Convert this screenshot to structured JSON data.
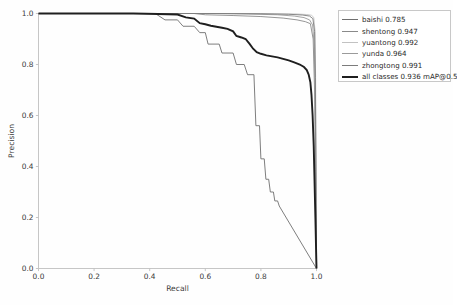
{
  "chart_data": {
    "type": "line",
    "title": "",
    "xlabel": "Recall",
    "ylabel": "Precision",
    "xlim": [
      0.0,
      1.0
    ],
    "ylim": [
      0.0,
      1.0
    ],
    "xticks": [
      "0.0",
      "0.2",
      "0.4",
      "0.6",
      "0.8",
      "1.0"
    ],
    "yticks": [
      "0.0",
      "0.2",
      "0.4",
      "0.6",
      "0.8",
      "1.0"
    ],
    "xtick_values": [
      0.0,
      0.2,
      0.4,
      0.6,
      0.8,
      1.0
    ],
    "ytick_values": [
      0.0,
      0.2,
      0.4,
      0.6,
      0.8,
      1.0
    ],
    "grid": false,
    "legend_position": "upper right outside",
    "metric_label": "mAP@0.5",
    "series": [
      {
        "name": "baishi",
        "score": "0.785",
        "label": "baishi 0.785",
        "color": "#6f6f6f",
        "width": 0.9,
        "points": [
          [
            0.0,
            1.0
          ],
          [
            0.3,
            1.0
          ],
          [
            0.42,
            1.0
          ],
          [
            0.455,
            0.975
          ],
          [
            0.5,
            0.975
          ],
          [
            0.52,
            0.95
          ],
          [
            0.56,
            0.95
          ],
          [
            0.58,
            0.925
          ],
          [
            0.6,
            0.925
          ],
          [
            0.61,
            0.88
          ],
          [
            0.65,
            0.88
          ],
          [
            0.66,
            0.845
          ],
          [
            0.7,
            0.845
          ],
          [
            0.712,
            0.8
          ],
          [
            0.74,
            0.8
          ],
          [
            0.752,
            0.76
          ],
          [
            0.775,
            0.76
          ],
          [
            0.782,
            0.56
          ],
          [
            0.795,
            0.56
          ],
          [
            0.8,
            0.43
          ],
          [
            0.812,
            0.43
          ],
          [
            0.818,
            0.35
          ],
          [
            0.828,
            0.35
          ],
          [
            0.834,
            0.3
          ],
          [
            0.845,
            0.3
          ],
          [
            0.85,
            0.265
          ],
          [
            0.86,
            0.265
          ],
          [
            0.866,
            0.245
          ],
          [
            1.0,
            0.0
          ]
        ]
      },
      {
        "name": "shentong",
        "score": "0.947",
        "label": "shentong 0.947",
        "color": "#8a8a8a",
        "width": 0.9,
        "points": [
          [
            0.0,
            1.0
          ],
          [
            0.56,
            1.0
          ],
          [
            0.6,
            0.995
          ],
          [
            0.7,
            0.992
          ],
          [
            0.8,
            0.988
          ],
          [
            0.88,
            0.982
          ],
          [
            0.93,
            0.975
          ],
          [
            0.96,
            0.968
          ],
          [
            0.978,
            0.96
          ],
          [
            0.988,
            0.9
          ],
          [
            0.993,
            0.7
          ],
          [
            0.996,
            0.4
          ],
          [
            0.999,
            0.1
          ],
          [
            1.0,
            0.0
          ]
        ]
      },
      {
        "name": "yuantong",
        "score": "0.992",
        "label": "yuantong 0.992",
        "color": "#c2c2c2",
        "width": 0.9,
        "points": [
          [
            0.0,
            1.0
          ],
          [
            0.7,
            1.0
          ],
          [
            0.85,
            0.999
          ],
          [
            0.93,
            0.998
          ],
          [
            0.965,
            0.996
          ],
          [
            0.982,
            0.993
          ],
          [
            0.99,
            0.985
          ],
          [
            0.995,
            0.93
          ],
          [
            0.997,
            0.72
          ],
          [
            0.999,
            0.3
          ],
          [
            1.0,
            0.0
          ]
        ]
      },
      {
        "name": "yunda",
        "score": "0.964",
        "label": "yunda 0.964",
        "color": "#9b9b9b",
        "width": 0.9,
        "points": [
          [
            0.0,
            1.0
          ],
          [
            0.62,
            1.0
          ],
          [
            0.75,
            0.998
          ],
          [
            0.86,
            0.995
          ],
          [
            0.92,
            0.99
          ],
          [
            0.955,
            0.984
          ],
          [
            0.975,
            0.975
          ],
          [
            0.986,
            0.955
          ],
          [
            0.992,
            0.87
          ],
          [
            0.996,
            0.6
          ],
          [
            0.999,
            0.2
          ],
          [
            1.0,
            0.0
          ]
        ]
      },
      {
        "name": "zhongtong",
        "score": "0.991",
        "label": "zhongtong 0.991",
        "color": "#7c7c7c",
        "width": 0.9,
        "points": [
          [
            0.0,
            1.0
          ],
          [
            0.66,
            1.0
          ],
          [
            0.8,
            0.999
          ],
          [
            0.9,
            0.997
          ],
          [
            0.95,
            0.994
          ],
          [
            0.975,
            0.99
          ],
          [
            0.987,
            0.98
          ],
          [
            0.993,
            0.93
          ],
          [
            0.996,
            0.75
          ],
          [
            0.998,
            0.38
          ],
          [
            1.0,
            0.0
          ]
        ]
      },
      {
        "name": "all classes",
        "score": "0.936",
        "label": "all classes 0.936 mAP@0.5",
        "color": "#1f1f1f",
        "width": 1.9,
        "points": [
          [
            0.0,
            1.0
          ],
          [
            0.34,
            1.0
          ],
          [
            0.43,
            0.998
          ],
          [
            0.5,
            0.996
          ],
          [
            0.53,
            0.985
          ],
          [
            0.56,
            0.98
          ],
          [
            0.58,
            0.962
          ],
          [
            0.6,
            0.958
          ],
          [
            0.62,
            0.952
          ],
          [
            0.64,
            0.948
          ],
          [
            0.66,
            0.944
          ],
          [
            0.68,
            0.94
          ],
          [
            0.7,
            0.93
          ],
          [
            0.712,
            0.912
          ],
          [
            0.73,
            0.906
          ],
          [
            0.745,
            0.9
          ],
          [
            0.76,
            0.88
          ],
          [
            0.772,
            0.862
          ],
          [
            0.785,
            0.848
          ],
          [
            0.8,
            0.842
          ],
          [
            0.82,
            0.836
          ],
          [
            0.84,
            0.832
          ],
          [
            0.86,
            0.828
          ],
          [
            0.88,
            0.822
          ],
          [
            0.9,
            0.816
          ],
          [
            0.92,
            0.808
          ],
          [
            0.94,
            0.8
          ],
          [
            0.955,
            0.79
          ],
          [
            0.965,
            0.778
          ],
          [
            0.972,
            0.76
          ],
          [
            0.978,
            0.73
          ],
          [
            0.982,
            0.68
          ],
          [
            0.986,
            0.6
          ],
          [
            0.99,
            0.48
          ],
          [
            0.993,
            0.34
          ],
          [
            0.996,
            0.2
          ],
          [
            0.998,
            0.1
          ],
          [
            1.0,
            0.0
          ]
        ]
      }
    ]
  },
  "axes": {
    "xlabel": "Recall",
    "ylabel": "Precision"
  }
}
